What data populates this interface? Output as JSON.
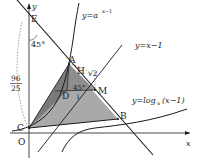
{
  "diagram": {
    "curves": {
      "exp": "y=a^{x-1}",
      "exp_label_main": "y=a",
      "exp_label_sup": "x−1",
      "line": "y=x−1",
      "log_label_main": "y=log",
      "log_label_sub": "a",
      "log_label_tail": "(x−1)"
    },
    "points": {
      "E": "E",
      "A": "A",
      "H": "H",
      "D": "D",
      "M": "M",
      "B": "B",
      "C": "C",
      "O": "O"
    },
    "axes": {
      "x": "x",
      "y": "y"
    },
    "annotations": {
      "angle_E": "45°",
      "angle_D": "45°",
      "length_AE": "96",
      "length_AE_den": "25",
      "length_HM": "√2",
      "tick_DM": "1"
    },
    "colors": {
      "shade_dark": "#6e6e6e",
      "shade_light": "#a9a9a9",
      "line": "#1a1a1a"
    }
  }
}
